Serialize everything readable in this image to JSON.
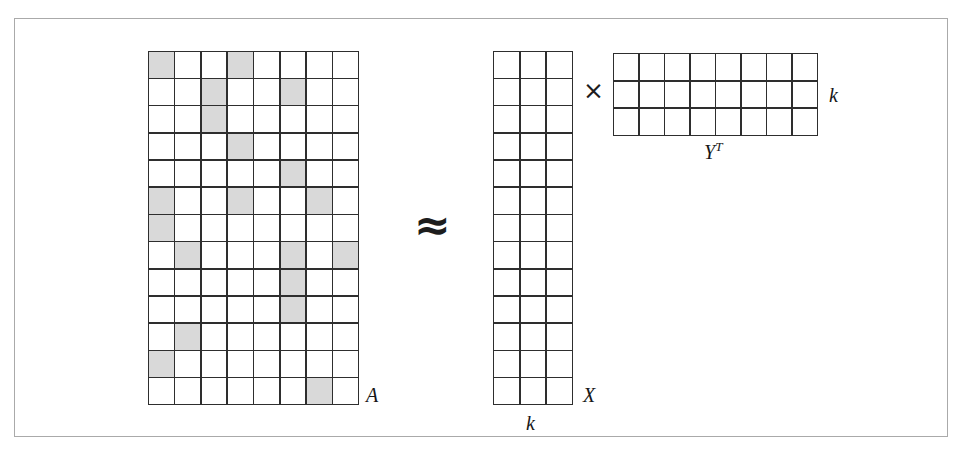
{
  "figure": {
    "kind": "matrix-factorization-diagram",
    "caption_equation": "A ≈ X × Yᵀ",
    "background_color": "#ffffff",
    "frame_color": "#aaaaaa",
    "grid_line_color": "#2e2e2e",
    "shaded_cell_color": "#d9d9d9",
    "empty_cell_color": "#ffffff",
    "label_color": "#171717"
  },
  "operators": {
    "approx": "≈",
    "times": "×"
  },
  "matrices": {
    "a": {
      "label": "A",
      "rows": 13,
      "cols": 8,
      "shaded_cells": [
        [
          1,
          1
        ],
        [
          1,
          4
        ],
        [
          2,
          3
        ],
        [
          2,
          6
        ],
        [
          3,
          3
        ],
        [
          4,
          4
        ],
        [
          5,
          6
        ],
        [
          6,
          1
        ],
        [
          6,
          4
        ],
        [
          6,
          7
        ],
        [
          7,
          1
        ],
        [
          8,
          2
        ],
        [
          8,
          6
        ],
        [
          8,
          8
        ],
        [
          9,
          6
        ],
        [
          10,
          6
        ],
        [
          11,
          2
        ],
        [
          12,
          1
        ],
        [
          13,
          7
        ]
      ],
      "shaded_count": 19,
      "total_cells": 104
    },
    "x": {
      "label": "X",
      "rows": 13,
      "cols": 3,
      "dimension_label": "k",
      "dimension_label_position": "bottom",
      "shaded_cells": [],
      "total_cells": 39
    },
    "yt": {
      "label_base": "Y",
      "label_superscript": "T",
      "rows": 3,
      "cols": 8,
      "dimension_label": "k",
      "dimension_label_position": "right",
      "shaded_cells": [],
      "total_cells": 24
    }
  },
  "chart_data": {
    "type": "heatmap",
    "title": "",
    "xlabel": "",
    "ylabel": "",
    "rank_k": 3,
    "series": [
      {
        "name": "A",
        "rows": 13,
        "cols": 8,
        "matrix": [
          [
            1,
            0,
            0,
            1,
            0,
            0,
            0,
            0
          ],
          [
            0,
            0,
            1,
            0,
            0,
            1,
            0,
            0
          ],
          [
            0,
            0,
            1,
            0,
            0,
            0,
            0,
            0
          ],
          [
            0,
            0,
            0,
            1,
            0,
            0,
            0,
            0
          ],
          [
            0,
            0,
            0,
            0,
            0,
            1,
            0,
            0
          ],
          [
            1,
            0,
            0,
            1,
            0,
            0,
            1,
            0
          ],
          [
            1,
            0,
            0,
            0,
            0,
            0,
            0,
            0
          ],
          [
            0,
            1,
            0,
            0,
            0,
            1,
            0,
            1
          ],
          [
            0,
            0,
            0,
            0,
            0,
            1,
            0,
            0
          ],
          [
            0,
            0,
            0,
            0,
            0,
            1,
            0,
            0
          ],
          [
            0,
            1,
            0,
            0,
            0,
            0,
            0,
            0
          ],
          [
            1,
            0,
            0,
            0,
            0,
            0,
            0,
            0
          ],
          [
            0,
            0,
            0,
            0,
            0,
            0,
            1,
            0
          ]
        ]
      },
      {
        "name": "X",
        "rows": 13,
        "cols": 3,
        "matrix": [
          [
            0,
            0,
            0
          ],
          [
            0,
            0,
            0
          ],
          [
            0,
            0,
            0
          ],
          [
            0,
            0,
            0
          ],
          [
            0,
            0,
            0
          ],
          [
            0,
            0,
            0
          ],
          [
            0,
            0,
            0
          ],
          [
            0,
            0,
            0
          ],
          [
            0,
            0,
            0
          ],
          [
            0,
            0,
            0
          ],
          [
            0,
            0,
            0
          ],
          [
            0,
            0,
            0
          ],
          [
            0,
            0,
            0
          ]
        ]
      },
      {
        "name": "Y^T",
        "rows": 3,
        "cols": 8,
        "matrix": [
          [
            0,
            0,
            0,
            0,
            0,
            0,
            0,
            0
          ],
          [
            0,
            0,
            0,
            0,
            0,
            0,
            0,
            0
          ],
          [
            0,
            0,
            0,
            0,
            0,
            0,
            0,
            0
          ]
        ]
      }
    ],
    "legend": [
      {
        "label": "observed / non-zero entry",
        "color": "#d9d9d9"
      },
      {
        "label": "missing / zero entry",
        "color": "#ffffff"
      }
    ],
    "grid": true,
    "legend_position": "none"
  }
}
